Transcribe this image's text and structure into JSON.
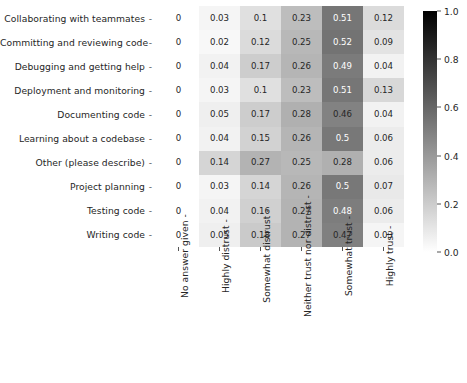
{
  "chart_data": {
    "type": "heatmap",
    "title": "",
    "xlabel": "",
    "ylabel": "",
    "grid": false,
    "legend_position": "right",
    "colormap": "Greys",
    "colorbar": {
      "min": 0.0,
      "max": 1.0,
      "ticks": [
        1.0,
        0.8,
        0.6,
        0.4,
        0.2,
        0.0
      ],
      "tick_labels": [
        "1.0",
        "0.8",
        "0.6",
        "0.4",
        "0.2",
        "0.0"
      ]
    },
    "categories_x": [
      "No answer given",
      "Highly distrust",
      "Somewhat distrust",
      "Neither trust nor distrust",
      "Somewhat trust",
      "Highly trust"
    ],
    "categories_y": [
      "Collaborating with teammates",
      "Committing and reviewing code",
      "Debugging and getting help",
      "Deployment and monitoring",
      "Documenting code",
      "Learning about a codebase",
      "Other (please describe)",
      "Project planning",
      "Testing code",
      "Writing code"
    ],
    "values": [
      [
        0,
        0.03,
        0.1,
        0.23,
        0.51,
        0.12
      ],
      [
        0,
        0.02,
        0.12,
        0.25,
        0.52,
        0.09
      ],
      [
        0,
        0.04,
        0.17,
        0.26,
        0.49,
        0.04
      ],
      [
        0,
        0.03,
        0.1,
        0.23,
        0.51,
        0.13
      ],
      [
        0,
        0.05,
        0.17,
        0.28,
        0.46,
        0.04
      ],
      [
        0,
        0.04,
        0.15,
        0.26,
        0.5,
        0.06
      ],
      [
        0,
        0.14,
        0.27,
        0.25,
        0.28,
        0.06
      ],
      [
        0,
        0.03,
        0.14,
        0.26,
        0.5,
        0.07
      ],
      [
        0,
        0.04,
        0.16,
        0.27,
        0.48,
        0.06
      ],
      [
        0,
        0.05,
        0.18,
        0.27,
        0.47,
        0.03
      ]
    ],
    "annotations": [
      [
        "0",
        "0.03",
        "0.1",
        "0.23",
        "0.51",
        "0.12"
      ],
      [
        "0",
        "0.02",
        "0.12",
        "0.25",
        "0.52",
        "0.09"
      ],
      [
        "0",
        "0.04",
        "0.17",
        "0.26",
        "0.49",
        "0.04"
      ],
      [
        "0",
        "0.03",
        "0.1",
        "0.23",
        "0.51",
        "0.13"
      ],
      [
        "0",
        "0.05",
        "0.17",
        "0.28",
        "0.46",
        "0.04"
      ],
      [
        "0",
        "0.04",
        "0.15",
        "0.26",
        "0.5",
        "0.06"
      ],
      [
        "0",
        "0.14",
        "0.27",
        "0.25",
        "0.28",
        "0.06"
      ],
      [
        "0",
        "0.03",
        "0.14",
        "0.26",
        "0.5",
        "0.07"
      ],
      [
        "0",
        "0.04",
        "0.16",
        "0.27",
        "0.48",
        "0.06"
      ],
      [
        "0",
        "0.05",
        "0.18",
        "0.27",
        "0.47",
        "0.03"
      ]
    ],
    "tick_dash": "-"
  }
}
